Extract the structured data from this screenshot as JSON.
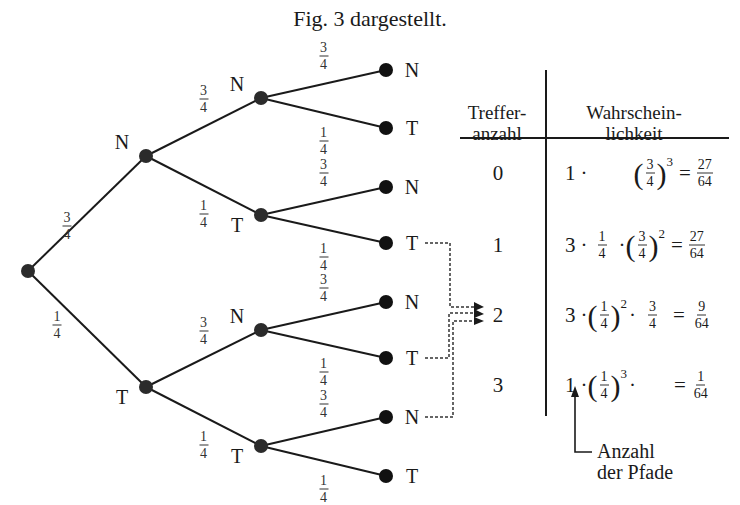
{
  "caption": "Fig. 3 dargestellt.",
  "tree": {
    "nodes": [
      {
        "id": "root",
        "x": 28,
        "y": 271,
        "label": ""
      },
      {
        "id": "N",
        "x": 146,
        "y": 156,
        "label": "N"
      },
      {
        "id": "T",
        "x": 146,
        "y": 387,
        "label": "T"
      },
      {
        "id": "NN",
        "x": 261,
        "y": 98,
        "label": "N"
      },
      {
        "id": "NT",
        "x": 261,
        "y": 215,
        "label": "T"
      },
      {
        "id": "TN",
        "x": 261,
        "y": 330,
        "label": "N"
      },
      {
        "id": "TT",
        "x": 261,
        "y": 446,
        "label": "T"
      },
      {
        "id": "NNN",
        "x": 386,
        "y": 70,
        "label": "N"
      },
      {
        "id": "NNT",
        "x": 386,
        "y": 128,
        "label": "T"
      },
      {
        "id": "NTN",
        "x": 386,
        "y": 187,
        "label": "N"
      },
      {
        "id": "NTT",
        "x": 386,
        "y": 243,
        "label": "T"
      },
      {
        "id": "TNN",
        "x": 386,
        "y": 302,
        "label": "N"
      },
      {
        "id": "TNT",
        "x": 386,
        "y": 358,
        "label": "T"
      },
      {
        "id": "TTN",
        "x": 386,
        "y": 417,
        "label": "N"
      },
      {
        "id": "TTT",
        "x": 386,
        "y": 476,
        "label": "T"
      }
    ],
    "edges": [
      {
        "from": "root",
        "to": "N",
        "num": "3",
        "den": "4"
      },
      {
        "from": "root",
        "to": "T",
        "num": "1",
        "den": "4"
      },
      {
        "from": "N",
        "to": "NN",
        "num": "3",
        "den": "4"
      },
      {
        "from": "N",
        "to": "NT",
        "num": "1",
        "den": "4"
      },
      {
        "from": "T",
        "to": "TN",
        "num": "3",
        "den": "4"
      },
      {
        "from": "T",
        "to": "TT",
        "num": "1",
        "den": "4"
      },
      {
        "from": "NN",
        "to": "NNN",
        "num": "3",
        "den": "4"
      },
      {
        "from": "NN",
        "to": "NNT",
        "num": "1",
        "den": "4"
      },
      {
        "from": "NT",
        "to": "NTN",
        "num": "3",
        "den": "4"
      },
      {
        "from": "NT",
        "to": "NTT",
        "num": "1",
        "den": "4"
      },
      {
        "from": "TN",
        "to": "TNN",
        "num": "3",
        "den": "4"
      },
      {
        "from": "TN",
        "to": "TNT",
        "num": "1",
        "den": "4"
      },
      {
        "from": "TT",
        "to": "TTN",
        "num": "3",
        "den": "4"
      },
      {
        "from": "TT",
        "to": "TTT",
        "num": "1",
        "den": "4"
      }
    ]
  },
  "table": {
    "header_count": [
      "Treffer-",
      "anzahl"
    ],
    "header_prob": [
      "Wahrschein-",
      "lichkeit"
    ],
    "rows": [
      {
        "count": "0",
        "paths": "1",
        "p1": "",
        "p1_exp": "",
        "p2_num": "3",
        "p2_den": "4",
        "p2_exp": "3",
        "res_num": "27",
        "res_den": "64"
      },
      {
        "count": "1",
        "paths": "3",
        "p1_num": "1",
        "p1_den": "4",
        "p1_exp": "",
        "p2_num": "3",
        "p2_den": "4",
        "p2_exp": "2",
        "res_num": "27",
        "res_den": "64"
      },
      {
        "count": "2",
        "paths": "3",
        "p1_num": "1",
        "p1_den": "4",
        "p1_exp": "2",
        "p2_num": "3",
        "p2_den": "4",
        "p2_exp": "",
        "res_num": "9",
        "res_den": "64"
      },
      {
        "count": "3",
        "paths": "1",
        "p1_num": "1",
        "p1_den": "4",
        "p1_exp": "3",
        "p2_num": "",
        "p2_den": "",
        "p2_exp": "",
        "res_num": "1",
        "res_den": "64"
      }
    ],
    "note": [
      "Anzahl",
      "der Pfade"
    ]
  },
  "symbols": {
    "dot": "·",
    "eq": "=",
    "lparen": "(",
    "rparen": ")"
  },
  "colors": {
    "line": "#1a1a1a",
    "node": "#2b2b2b",
    "dotted": "#333333"
  }
}
